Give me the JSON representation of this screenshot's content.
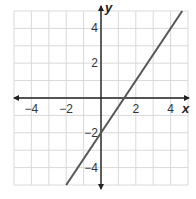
{
  "chart_data": {
    "type": "line",
    "title": "",
    "xlabel": "x",
    "ylabel": "y",
    "xlim": [
      -5,
      5
    ],
    "ylim": [
      -5,
      5
    ],
    "grid": true,
    "grid_step": 1,
    "x_ticks": [
      {
        "value": -4,
        "label": "−4"
      },
      {
        "value": -2,
        "label": "−2"
      },
      {
        "value": 2,
        "label": "2"
      },
      {
        "value": 4,
        "label": "4"
      }
    ],
    "y_ticks": [
      {
        "value": 4,
        "label": "4"
      },
      {
        "value": 2,
        "label": "2"
      },
      {
        "value": -2,
        "label": "−2"
      },
      {
        "value": -4,
        "label": "−4"
      }
    ],
    "series": [
      {
        "name": "y = 1.5x − 2",
        "slope": 1.5,
        "intercept": -2,
        "x": [
          -2,
          4.6667
        ],
        "y": [
          -5,
          5
        ],
        "color": "#555555"
      }
    ],
    "legend": null
  },
  "colors": {
    "grid": "#d9d9d9",
    "axis": "#222222",
    "line": "#555555"
  }
}
